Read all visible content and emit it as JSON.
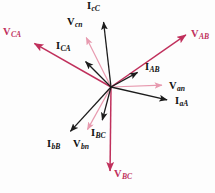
{
  "figure": {
    "type": "phasor-diagram",
    "width": 215,
    "height": 193,
    "background": "#ffffff",
    "origin": {
      "x": 111,
      "y": 87
    }
  },
  "colors": {
    "line_voltage": "#c0305c",
    "phase_voltage": "#e79aaf",
    "current": "#1c1c1c",
    "label_dark": "#111111",
    "label_crimson": "#c0305c"
  },
  "chart_data": {
    "type": "scatter",
    "xlabel": "",
    "ylabel": "",
    "origin": {
      "x": 111,
      "y": 87
    },
    "legend": [
      {
        "name": "line voltages",
        "color": "#c0305c",
        "items": [
          "V_AB",
          "V_BC",
          "V_CA"
        ]
      },
      {
        "name": "phase voltages",
        "color": "#e79aaf",
        "items": [
          "V_an",
          "V_bn",
          "V_cn"
        ]
      },
      {
        "name": "currents",
        "color": "#1c1c1c",
        "items": [
          "I_aA",
          "I_bB",
          "I_cC",
          "I_AB",
          "I_BC",
          "I_CA"
        ]
      }
    ],
    "phasors": [
      {
        "id": "V_AB",
        "label": "V",
        "subscript": "AB",
        "group": "line-voltage",
        "color": "#c0305c",
        "angle_deg": 34.8,
        "length_px": 96,
        "tip": {
          "x": 190,
          "y": 32
        },
        "label_pos": {
          "x": 191,
          "y": 29
        },
        "stroke_width": 1.5
      },
      {
        "id": "V_BC",
        "label": "V",
        "subscript": "BC",
        "group": "line-voltage",
        "color": "#c0305c",
        "angle_deg": -89.0,
        "length_px": 88,
        "tip": {
          "x": 110,
          "y": 176
        },
        "label_pos": {
          "x": 114,
          "y": 169
        },
        "stroke_width": 1.5
      },
      {
        "id": "V_CA",
        "label": "V",
        "subscript": "CA",
        "group": "line-voltage",
        "color": "#c0305c",
        "angle_deg": 154.5,
        "length_px": 90,
        "tip": {
          "x": 30,
          "y": 41
        },
        "label_pos": {
          "x": 3,
          "y": 27
        },
        "stroke_width": 1.5
      },
      {
        "id": "V_an",
        "label": "V",
        "subscript": "an",
        "group": "phase-voltage",
        "color": "#e79aaf",
        "angle_deg": 2.0,
        "length_px": 56,
        "tip": {
          "x": 167,
          "y": 85
        },
        "label_pos": {
          "x": 169,
          "y": 81
        },
        "stroke_width": 1.2
      },
      {
        "id": "V_bn",
        "label": "V",
        "subscript": "bn",
        "group": "phase-voltage",
        "color": "#e79aaf",
        "angle_deg": -118.0,
        "length_px": 54,
        "tip": {
          "x": 85,
          "y": 134
        },
        "label_pos": {
          "x": 73,
          "y": 139
        },
        "stroke_width": 1.2
      },
      {
        "id": "V_cn",
        "label": "V",
        "subscript": "cn",
        "group": "phase-voltage",
        "color": "#e79aaf",
        "angle_deg": 116.5,
        "length_px": 60,
        "tip": {
          "x": 84,
          "y": 33
        },
        "label_pos": {
          "x": 67,
          "y": 17
        },
        "stroke_width": 1.2
      },
      {
        "id": "I_aA",
        "label": "I",
        "subscript": "aA",
        "group": "current",
        "color": "#1c1c1c",
        "angle_deg": -12.8,
        "length_px": 63,
        "tip": {
          "x": 172,
          "y": 101
        },
        "label_pos": {
          "x": 175,
          "y": 96
        },
        "stroke_width": 1.3
      },
      {
        "id": "I_bB",
        "label": "I",
        "subscript": "bB",
        "group": "current",
        "color": "#1c1c1c",
        "angle_deg": -132.5,
        "length_px": 64,
        "tip": {
          "x": 67,
          "y": 135
        },
        "label_pos": {
          "x": 47,
          "y": 139
        },
        "stroke_width": 1.3
      },
      {
        "id": "I_cC",
        "label": "I",
        "subscript": "cC",
        "group": "current",
        "color": "#1c1c1c",
        "angle_deg": 96.3,
        "length_px": 71,
        "tip": {
          "x": 103,
          "y": 17
        },
        "label_pos": {
          "x": 87,
          "y": 1
        },
        "stroke_width": 1.3
      },
      {
        "id": "I_AB",
        "label": "I",
        "subscript": "AB",
        "group": "current",
        "color": "#1c1c1c",
        "angle_deg": 30.0,
        "length_px": 35,
        "tip": {
          "x": 142,
          "y": 70
        },
        "label_pos": {
          "x": 145,
          "y": 62
        },
        "stroke_width": 1.3
      },
      {
        "id": "I_BC",
        "label": "I",
        "subscript": "BC",
        "group": "current",
        "color": "#1c1c1c",
        "angle_deg": -76.0,
        "length_px": 39,
        "tip": {
          "x": 101,
          "y": 125
        },
        "label_pos": {
          "x": 91,
          "y": 128
        },
        "stroke_width": 1.3
      },
      {
        "id": "I_CA",
        "label": "I",
        "subscript": "CA",
        "group": "current",
        "color": "#1c1c1c",
        "angle_deg": 136.5,
        "length_px": 41,
        "tip": {
          "x": 82,
          "y": 58
        },
        "label_pos": {
          "x": 56,
          "y": 41
        },
        "stroke_width": 1.3
      }
    ]
  }
}
